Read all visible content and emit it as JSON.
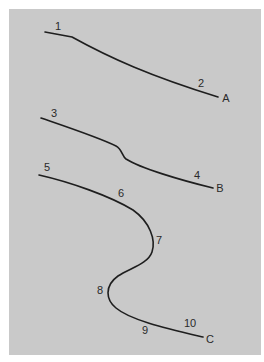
{
  "diagram": {
    "background_color": "#c9c9c9",
    "line_color": "#1e1e1e",
    "curves": [
      {
        "id": "A",
        "label": "A",
        "description": "Gently descending line with slight bend near start",
        "points_labels": [
          "1",
          "2"
        ]
      },
      {
        "id": "B",
        "label": "B",
        "description": "Descending line with a small kink in the middle",
        "points_labels": [
          "3",
          "4"
        ]
      },
      {
        "id": "C",
        "label": "C",
        "description": "S-shaped curve bulging right then left before descending to end",
        "points_labels": [
          "5",
          "6",
          "7",
          "8",
          "9",
          "10"
        ]
      }
    ],
    "labels": {
      "p1": "1",
      "p2": "2",
      "endA": "A",
      "p3": "3",
      "p4": "4",
      "endB": "B",
      "p5": "5",
      "p6": "6",
      "p7": "7",
      "p8": "8",
      "p9": "9",
      "p10": "10",
      "endC": "C"
    }
  }
}
